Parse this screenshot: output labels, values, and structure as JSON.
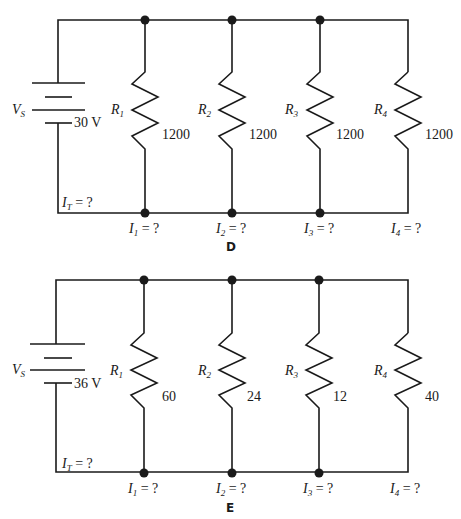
{
  "circuits": [
    {
      "id": "D",
      "figure_label": "D",
      "source": {
        "symbol": "V",
        "subscript": "S",
        "value": "30 V"
      },
      "total_current": {
        "symbol": "I",
        "subscript": "T",
        "value": "= ?"
      },
      "resistors": [
        {
          "symbol": "R",
          "subscript": "1",
          "value": "1200",
          "current": {
            "symbol": "I",
            "subscript": "1",
            "value": "= ?"
          }
        },
        {
          "symbol": "R",
          "subscript": "2",
          "value": "1200",
          "current": {
            "symbol": "I",
            "subscript": "2",
            "value": "= ?"
          }
        },
        {
          "symbol": "R",
          "subscript": "3",
          "value": "1200",
          "current": {
            "symbol": "I",
            "subscript": "3",
            "value": "= ?"
          }
        },
        {
          "symbol": "R",
          "subscript": "4",
          "value": "1200",
          "current": {
            "symbol": "I",
            "subscript": "4",
            "value": "= ?"
          }
        }
      ]
    },
    {
      "id": "E",
      "figure_label": "E",
      "source": {
        "symbol": "V",
        "subscript": "S",
        "value": "36 V"
      },
      "total_current": {
        "symbol": "I",
        "subscript": "T",
        "value": "= ?"
      },
      "resistors": [
        {
          "symbol": "R",
          "subscript": "1",
          "value": "60",
          "current": {
            "symbol": "I",
            "subscript": "1",
            "value": "= ?"
          }
        },
        {
          "symbol": "R",
          "subscript": "2",
          "value": "24",
          "current": {
            "symbol": "I",
            "subscript": "2",
            "value": "= ?"
          }
        },
        {
          "symbol": "R",
          "subscript": "3",
          "value": "12",
          "current": {
            "symbol": "I",
            "subscript": "3",
            "value": "= ?"
          }
        },
        {
          "symbol": "R",
          "subscript": "4",
          "value": "40",
          "current": {
            "symbol": "I",
            "subscript": "4",
            "value": "= ?"
          }
        }
      ]
    }
  ],
  "colors": {
    "line": "#1a1a1a",
    "background": "#ffffff"
  }
}
